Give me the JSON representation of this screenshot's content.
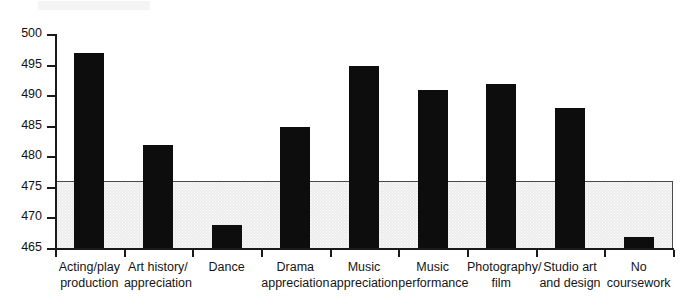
{
  "chart_data": {
    "type": "bar",
    "title": "",
    "subtitle": "",
    "xlabel": "",
    "ylabel": "",
    "ylim": [
      465,
      500
    ],
    "yticks": [
      465,
      470,
      475,
      480,
      485,
      490,
      495,
      500
    ],
    "grid": false,
    "legend": null,
    "bar_color": "#0d0d0d",
    "shaded_band": {
      "label": "",
      "from": 465,
      "to": 476.2,
      "fill_color": "#ececec",
      "border_color": "#4a4a4a"
    },
    "categories": [
      "Acting/play production",
      "Art history/ appreciation",
      "Dance",
      "Drama appreciation",
      "Music appreciation",
      "Music performance",
      "Photography/ film",
      "Studio art and design",
      "No coursework"
    ],
    "category_lines": [
      [
        "Acting/play",
        "production"
      ],
      [
        "Art history/",
        "appreciation"
      ],
      [
        "Dance",
        ""
      ],
      [
        "Drama",
        "appreciation"
      ],
      [
        "Music",
        "appreciation"
      ],
      [
        "Music",
        "performance"
      ],
      [
        "Photography/",
        "film"
      ],
      [
        "Studio art",
        "and design"
      ],
      [
        "No",
        "coursework"
      ]
    ],
    "values": [
      497,
      482,
      469,
      485,
      495,
      491,
      492,
      488,
      467
    ]
  }
}
